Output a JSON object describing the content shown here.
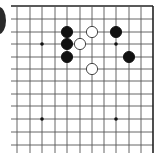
{
  "board": {
    "type": "go-board-fragment",
    "columns_x": [
      17,
      30,
      42,
      55,
      67,
      80,
      92,
      104,
      116,
      129,
      141,
      153
    ],
    "rows_y": [
      6,
      19,
      32,
      44,
      57,
      69,
      81,
      94,
      106,
      119,
      132,
      145
    ],
    "top_edge": true,
    "right_edge": true,
    "line_color": "#555555",
    "edge_color": "#222222",
    "star_points": [
      [
        2,
        3
      ],
      [
        8,
        3
      ],
      [
        2,
        9
      ],
      [
        8,
        9
      ]
    ],
    "stone_radius": 5.6,
    "colors": {
      "black": "#111111",
      "white": "#ffffff",
      "white_stroke": "#333333"
    },
    "stones": [
      {
        "color": "black",
        "col": 4,
        "row": 2
      },
      {
        "color": "black",
        "col": 4,
        "row": 3
      },
      {
        "color": "black",
        "col": 4,
        "row": 4
      },
      {
        "color": "white",
        "col": 5,
        "row": 3
      },
      {
        "color": "white",
        "col": 6,
        "row": 2
      },
      {
        "color": "white",
        "col": 6,
        "row": 5
      },
      {
        "color": "black",
        "col": 8,
        "row": 2
      },
      {
        "color": "black",
        "col": 9,
        "row": 4
      }
    ]
  }
}
